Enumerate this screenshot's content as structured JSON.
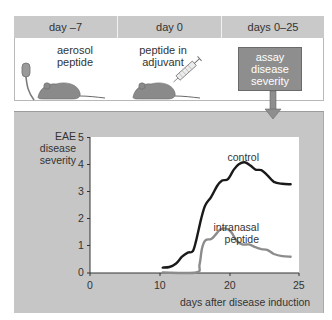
{
  "timeline": {
    "columns": [
      {
        "header": "day –7",
        "step": [
          "aerosol",
          "peptide"
        ],
        "icon": "aerosol-mouse-icon"
      },
      {
        "header": "day 0",
        "step": [
          "peptide in",
          "adjuvant"
        ],
        "icon": "syringe-mouse-icon"
      },
      {
        "header": "days 0–25",
        "step": [
          "assay",
          "disease",
          "severity"
        ],
        "icon": "down-arrow-icon"
      }
    ]
  },
  "colors": {
    "header_bg": "#c9c9c9",
    "panel_bg": "#c6c6c6",
    "assay_box": "#8e8e8e",
    "mouse": "#8a8a8a",
    "control_line": "#1a1a1a",
    "intranasal_line": "#8c8c8c"
  },
  "chart_data": {
    "type": "line",
    "title": "",
    "xlabel": "days after disease induction",
    "ylabel": "EAE disease severity",
    "xlim": [
      0,
      25
    ],
    "ylim": [
      0,
      5
    ],
    "xticks": [
      0,
      10,
      20,
      25
    ],
    "yticks": [
      0,
      1,
      2,
      3,
      4,
      5
    ],
    "grid": false,
    "legend": "inline labels",
    "series": [
      {
        "name": "control",
        "x": [
          8.7,
          9.5,
          10.3,
          11.0,
          11.7,
          12.3,
          12.7,
          13.3,
          13.8,
          14.5,
          15.2,
          15.8,
          16.5,
          17.2,
          17.8,
          18.5,
          19.2,
          19.8,
          20.5,
          21.2,
          22.0,
          23.0,
          24.0
        ],
        "values": [
          0.2,
          0.22,
          0.35,
          0.6,
          0.75,
          0.8,
          1.2,
          2.0,
          2.5,
          2.8,
          3.2,
          3.4,
          3.45,
          3.8,
          4.0,
          4.07,
          3.95,
          3.8,
          3.78,
          3.6,
          3.35,
          3.28,
          3.26
        ]
      },
      {
        "name": "intranasal peptide",
        "x": [
          8.7,
          12.7,
          13.1,
          13.4,
          13.8,
          14.5,
          15.0,
          15.6,
          16.3,
          16.9,
          17.5,
          18.2,
          19.0,
          19.8,
          20.5,
          21.2,
          22.0,
          23.0,
          24.0
        ],
        "values": [
          0.02,
          0.02,
          0.3,
          0.9,
          1.2,
          1.25,
          1.4,
          1.6,
          1.63,
          1.5,
          1.2,
          1.05,
          1.05,
          0.95,
          0.88,
          0.85,
          0.7,
          0.62,
          0.6
        ]
      }
    ],
    "annotations": [
      "control",
      "intranasal",
      "peptide"
    ]
  },
  "labels": {
    "ylabel_lines": [
      "EAE",
      "disease",
      "severity"
    ],
    "xlabel": "days after disease induction",
    "control": "control",
    "intranasal_1": "intranasal",
    "intranasal_2": "peptide"
  }
}
